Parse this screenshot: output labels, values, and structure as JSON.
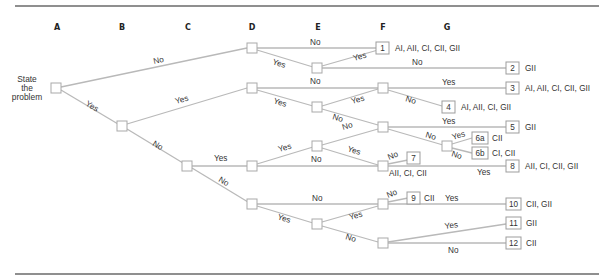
{
  "diagram": {
    "type": "decision-tree",
    "columns": [
      "A",
      "B",
      "C",
      "D",
      "E",
      "F",
      "G"
    ],
    "start_label": [
      "State",
      "the",
      "problem"
    ],
    "edge_labels": {
      "a_no": "No",
      "a_yes": "Yes",
      "b_yes": "Yes",
      "b_no": "No",
      "d1_no": "No",
      "d1_yes": "Yes",
      "e1_yes": "Yes",
      "e1_no": "No",
      "d2_no": "No",
      "d2_yes": "Yes",
      "f2_yes": "Yes",
      "f2_no": "No",
      "e2_yes": "Yes",
      "e2_no": "No",
      "e3_no": "No",
      "f3_yes": "Yes",
      "f3_no": "No",
      "g_yes": "Yes",
      "g_no": "No",
      "c_yes": "Yes",
      "c_no": "No",
      "d3_yes": "Yes",
      "d3_no": "No",
      "e3_yes": "Yes",
      "f4_no": "No",
      "f4_yes": "Yes",
      "d4_no": "No",
      "d4_yes": "Yes",
      "f5_no": "No",
      "f5_yes": "Yes",
      "e4_yes": "Yes",
      "e4_no": "No",
      "f6_yes": "Yes",
      "f6_no": "No"
    },
    "leaves": [
      {
        "id": "1",
        "styles": "AI, AII, CI, CII, GII"
      },
      {
        "id": "2",
        "styles": "GII"
      },
      {
        "id": "3",
        "styles": "AI, AII, CI, CII, GII"
      },
      {
        "id": "4",
        "styles": "AI, AII, CI, GII"
      },
      {
        "id": "5",
        "styles": "GII"
      },
      {
        "id": "6a",
        "styles": "CII"
      },
      {
        "id": "6b",
        "styles": "CI, CII"
      },
      {
        "id": "7",
        "styles": "AII, CI, CII"
      },
      {
        "id": "8",
        "styles": "AII, CI, CII, GII"
      },
      {
        "id": "9",
        "styles": "CII"
      },
      {
        "id": "10",
        "styles": "CII, GII"
      },
      {
        "id": "11",
        "styles": "GII"
      },
      {
        "id": "12",
        "styles": "CII"
      }
    ]
  }
}
